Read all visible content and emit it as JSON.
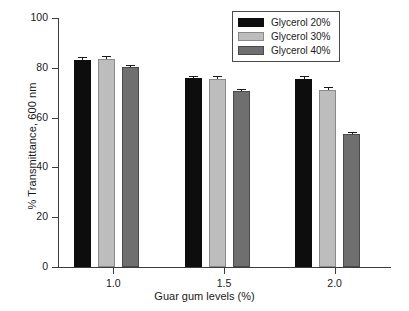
{
  "chart_data": {
    "type": "bar",
    "title": "",
    "subtitle": "",
    "xlabel": "Guar gum levels (%)",
    "ylabel": "% Transmittance, 600 nm",
    "categories": [
      "1.0",
      "1.5",
      "2.0"
    ],
    "series": [
      {
        "name": "Glycerol 20%",
        "color": "#0d0d0d",
        "values": [
          83.3,
          76.0,
          75.7
        ],
        "errors": [
          0.7,
          0.5,
          0.8
        ]
      },
      {
        "name": "Glycerol 30%",
        "color": "#bdbdbd",
        "values": [
          83.6,
          75.7,
          71.1
        ],
        "errors": [
          0.9,
          0.6,
          0.6
        ]
      },
      {
        "name": "Glycerol 40%",
        "color": "#6f6f6f",
        "values": [
          80.2,
          70.6,
          53.4
        ],
        "errors": [
          0.4,
          0.5,
          0.5
        ]
      }
    ],
    "ylim": [
      0,
      100
    ],
    "yticks": [
      0,
      20,
      40,
      60,
      80,
      100
    ],
    "ytick_labels": [
      "0",
      "20",
      "40",
      "60",
      "80",
      "100"
    ],
    "grid": false,
    "legend_position": "top-right",
    "legend_entries": [
      "Glycerol 20%",
      "Glycerol 30%",
      "Glycerol 40%"
    ]
  }
}
